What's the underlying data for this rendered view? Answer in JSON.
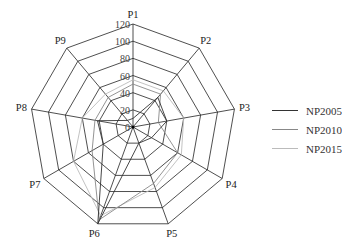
{
  "chart_data": {
    "type": "radar",
    "title": "",
    "axes": [
      "P1",
      "P2",
      "P3",
      "P4",
      "P5",
      "P6",
      "P7",
      "P8",
      "P9"
    ],
    "rlim": [
      0,
      120
    ],
    "ticks": [
      0,
      20,
      40,
      60,
      80,
      100,
      120
    ],
    "tick_labels": [
      "0",
      "20",
      "40",
      "60",
      "80",
      "100",
      "120"
    ],
    "grid": true,
    "legend_position": "right",
    "series": [
      {
        "name": "NP2005",
        "color": "#333333",
        "values": [
          10,
          45,
          40,
          25,
          20,
          120,
          40,
          42,
          10
        ]
      },
      {
        "name": "NP2010",
        "color": "#888888",
        "values": [
          50,
          50,
          30,
          60,
          70,
          115,
          55,
          45,
          45
        ]
      },
      {
        "name": "NP2015",
        "color": "#bbbbbb",
        "values": [
          55,
          55,
          60,
          65,
          75,
          110,
          80,
          60,
          50
        ]
      }
    ]
  }
}
